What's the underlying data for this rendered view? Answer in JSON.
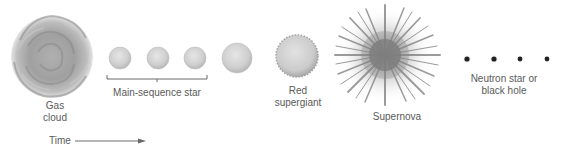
{
  "diagram": {
    "stages": [
      {
        "id": "gas-cloud",
        "label_lines": [
          "Gas",
          "cloud"
        ]
      },
      {
        "id": "main-sequence",
        "label": "Main-sequence star"
      },
      {
        "id": "red-supergiant",
        "label_lines": [
          "Red",
          "supergiant"
        ]
      },
      {
        "id": "supernova",
        "label": "Supernova"
      },
      {
        "id": "remnant",
        "label_lines": [
          "Neutron star or",
          "black hole"
        ]
      }
    ],
    "time_axis": {
      "label": "Time"
    }
  },
  "colors": {
    "gas_cloud": "#9a9a9a",
    "star_fill": "#d4d4d4",
    "star_edge": "#b0b0b0",
    "supergiant": "#c8c8c8",
    "supernova": "#7a7a7a",
    "remnant_dot": "#222222",
    "text": "#5a5a5a",
    "line": "#6a6a6a"
  }
}
